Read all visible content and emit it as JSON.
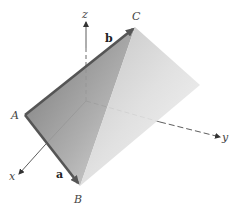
{
  "diagram": {
    "type": "3d-parallelogram-vectors",
    "axes": {
      "x": {
        "label": "x"
      },
      "y": {
        "label": "y"
      },
      "z": {
        "label": "z"
      }
    },
    "vertices": {
      "A": {
        "label": "A"
      },
      "B": {
        "label": "B"
      },
      "C": {
        "label": "C"
      }
    },
    "vectors": {
      "a": {
        "label": "a",
        "from": "A",
        "to": "B"
      },
      "b": {
        "label": "b",
        "from": "A",
        "to": "C"
      }
    },
    "colors": {
      "plane_dark": "#6e6e6e",
      "plane_light": "#f2f2f2",
      "edge": "#555555",
      "axis": "#333333"
    }
  }
}
